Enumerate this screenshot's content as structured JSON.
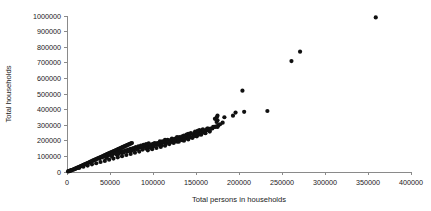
{
  "chart_data": {
    "type": "scatter",
    "title": "",
    "xlabel": "Total persons in households",
    "ylabel": "Total households",
    "xlim": [
      0,
      400000
    ],
    "ylim": [
      0,
      1000000
    ],
    "xticks": [
      0,
      50000,
      100000,
      150000,
      200000,
      250000,
      300000,
      350000,
      400000
    ],
    "yticks": [
      0,
      100000,
      200000,
      300000,
      400000,
      500000,
      600000,
      700000,
      800000,
      900000,
      1000000
    ],
    "xtick_labels": [
      "0",
      "50000",
      "100000",
      "150000",
      "200000",
      "250000",
      "300000",
      "350000",
      "400000"
    ],
    "ytick_labels": [
      "0",
      "100000",
      "200000",
      "300000",
      "400000",
      "500000",
      "600000",
      "700000",
      "800000",
      "900000",
      "1000000"
    ],
    "grid": false,
    "legend": false,
    "marker": "filled-circle",
    "marker_color": "#101010",
    "marker_size": 2.1,
    "series": [
      {
        "name": "households vs persons",
        "points": [
          [
            1200,
            3500
          ],
          [
            2400,
            5000
          ],
          [
            3600,
            8000
          ],
          [
            4800,
            10000
          ],
          [
            5500,
            12000
          ],
          [
            6500,
            14000
          ],
          [
            7600,
            16500
          ],
          [
            8500,
            19000
          ],
          [
            9600,
            21000
          ],
          [
            10400,
            23000
          ],
          [
            11500,
            26000
          ],
          [
            12400,
            28000
          ],
          [
            13500,
            31000
          ],
          [
            14600,
            33000
          ],
          [
            15500,
            36000
          ],
          [
            16400,
            38500
          ],
          [
            17500,
            41000
          ],
          [
            18600,
            44000
          ],
          [
            19500,
            46000
          ],
          [
            20500,
            49000
          ],
          [
            21500,
            51000
          ],
          [
            22600,
            54000
          ],
          [
            23500,
            56000
          ],
          [
            24500,
            59000
          ],
          [
            25500,
            61000
          ],
          [
            26400,
            64000
          ],
          [
            27500,
            66500
          ],
          [
            28500,
            69000
          ],
          [
            29500,
            71000
          ],
          [
            30500,
            74000
          ],
          [
            31500,
            76000
          ],
          [
            32500,
            79000
          ],
          [
            33500,
            81000
          ],
          [
            34600,
            84000
          ],
          [
            35500,
            86000
          ],
          [
            36500,
            89000
          ],
          [
            37500,
            91000
          ],
          [
            38500,
            94000
          ],
          [
            39500,
            96000
          ],
          [
            40500,
            99000
          ],
          [
            41500,
            101000
          ],
          [
            42500,
            104000
          ],
          [
            43500,
            106000
          ],
          [
            44500,
            109000
          ],
          [
            45500,
            111000
          ],
          [
            46500,
            114000
          ],
          [
            47500,
            116000
          ],
          [
            48500,
            119000
          ],
          [
            49500,
            121000
          ],
          [
            50500,
            124000
          ],
          [
            51500,
            126000
          ],
          [
            52500,
            129000
          ],
          [
            53500,
            131000
          ],
          [
            54500,
            134000
          ],
          [
            55500,
            136000
          ],
          [
            56500,
            139000
          ],
          [
            57500,
            141000
          ],
          [
            58500,
            144000
          ],
          [
            59500,
            146000
          ],
          [
            60500,
            149000
          ],
          [
            61500,
            151000
          ],
          [
            62500,
            154000
          ],
          [
            63500,
            156000
          ],
          [
            64500,
            159000
          ],
          [
            65500,
            161000
          ],
          [
            66500,
            164000
          ],
          [
            67500,
            166000
          ],
          [
            68500,
            169000
          ],
          [
            69500,
            171000
          ],
          [
            70500,
            174000
          ],
          [
            71500,
            176000
          ],
          [
            72500,
            179000
          ],
          [
            73500,
            181000
          ],
          [
            74500,
            184000
          ],
          [
            75500,
            186000
          ],
          [
            38000,
            86000
          ],
          [
            41000,
            94000
          ],
          [
            44000,
            99000
          ],
          [
            47000,
            104000
          ],
          [
            50000,
            109000
          ],
          [
            53000,
            114000
          ],
          [
            56000,
            119000
          ],
          [
            59000,
            124000
          ],
          [
            62000,
            129000
          ],
          [
            65000,
            134000
          ],
          [
            68000,
            139000
          ],
          [
            71000,
            144000
          ],
          [
            74000,
            149000
          ],
          [
            77000,
            154000
          ],
          [
            80000,
            159000
          ],
          [
            83000,
            164000
          ],
          [
            86000,
            169000
          ],
          [
            89000,
            174000
          ],
          [
            92000,
            179000
          ],
          [
            95000,
            184000
          ],
          [
            46000,
            91000
          ],
          [
            52000,
            101000
          ],
          [
            58000,
            111000
          ],
          [
            64000,
            121000
          ],
          [
            70000,
            131000
          ],
          [
            76000,
            141000
          ],
          [
            82000,
            151000
          ],
          [
            88000,
            161000
          ],
          [
            94000,
            171000
          ],
          [
            100000,
            181000
          ],
          [
            60000,
            116000
          ],
          [
            66000,
            126000
          ],
          [
            72000,
            136000
          ],
          [
            78000,
            146000
          ],
          [
            84000,
            156000
          ],
          [
            90000,
            166000
          ],
          [
            96000,
            176000
          ],
          [
            102000,
            186000
          ],
          [
            108000,
            196000
          ],
          [
            114000,
            206000
          ],
          [
            75000,
            136000
          ],
          [
            81000,
            146000
          ],
          [
            87000,
            156000
          ],
          [
            93000,
            166000
          ],
          [
            99000,
            176000
          ],
          [
            105000,
            186000
          ],
          [
            111000,
            196000
          ],
          [
            117000,
            206000
          ],
          [
            122000,
            214000
          ],
          [
            128000,
            224000
          ],
          [
            104000,
            176000
          ],
          [
            110000,
            186000
          ],
          [
            116000,
            196000
          ],
          [
            121000,
            204000
          ],
          [
            126000,
            214000
          ],
          [
            131000,
            224000
          ],
          [
            136000,
            234000
          ],
          [
            141000,
            244000
          ],
          [
            100000,
            166000
          ],
          [
            95000,
            156000
          ],
          [
            107000,
            181000
          ],
          [
            113000,
            191000
          ],
          [
            119000,
            201000
          ],
          [
            124000,
            209000
          ],
          [
            129000,
            219000
          ],
          [
            134000,
            229000
          ],
          [
            139000,
            239000
          ],
          [
            144000,
            249000
          ],
          [
            149000,
            259000
          ],
          [
            154000,
            269000
          ],
          [
            118000,
            191000
          ],
          [
            123000,
            199000
          ],
          [
            128000,
            209000
          ],
          [
            133000,
            219000
          ],
          [
            138000,
            229000
          ],
          [
            143000,
            239000
          ],
          [
            148000,
            249000
          ],
          [
            153000,
            259000
          ],
          [
            158000,
            269000
          ],
          [
            163000,
            279000
          ],
          [
            132000,
            209000
          ],
          [
            137000,
            219000
          ],
          [
            142000,
            229000
          ],
          [
            147000,
            239000
          ],
          [
            152000,
            249000
          ],
          [
            157000,
            259000
          ],
          [
            162000,
            269000
          ],
          [
            167000,
            279000
          ],
          [
            172000,
            289000
          ],
          [
            176000,
            299000
          ],
          [
            146000,
            219000
          ],
          [
            151000,
            229000
          ],
          [
            156000,
            239000
          ],
          [
            161000,
            249000
          ],
          [
            166000,
            259000
          ],
          [
            128000,
            194000
          ],
          [
            134000,
            204000
          ],
          [
            140000,
            214000
          ],
          [
            145000,
            221000
          ],
          [
            150000,
            231000
          ],
          [
            110000,
            171000
          ],
          [
            115000,
            179000
          ],
          [
            120000,
            189000
          ],
          [
            125000,
            196000
          ],
          [
            130000,
            204000
          ],
          [
            88000,
            144000
          ],
          [
            92000,
            151000
          ],
          [
            97000,
            159000
          ],
          [
            101000,
            166000
          ],
          [
            106000,
            174000
          ],
          [
            119000,
            179000
          ],
          [
            124000,
            186000
          ],
          [
            130000,
            194000
          ],
          [
            136000,
            201000
          ],
          [
            141000,
            209000
          ],
          [
            136000,
            211000
          ],
          [
            142000,
            221000
          ],
          [
            148000,
            231000
          ],
          [
            154000,
            241000
          ],
          [
            160000,
            251000
          ],
          [
            151000,
            249000
          ],
          [
            157000,
            259000
          ],
          [
            163000,
            269000
          ],
          [
            169000,
            279000
          ],
          [
            175000,
            289000
          ],
          [
            164000,
            279000
          ],
          [
            170000,
            289000
          ],
          [
            176000,
            299000
          ],
          [
            152000,
            264000
          ],
          [
            158000,
            274000
          ],
          [
            109000,
            161000
          ],
          [
            114000,
            169000
          ],
          [
            104000,
            154000
          ],
          [
            99000,
            146000
          ],
          [
            94000,
            139000
          ],
          [
            84000,
            131000
          ],
          [
            79000,
            124000
          ],
          [
            74000,
            116000
          ],
          [
            69000,
            109000
          ],
          [
            64000,
            101000
          ],
          [
            59000,
            94000
          ],
          [
            54000,
            86000
          ],
          [
            49000,
            79000
          ],
          [
            44000,
            71000
          ],
          [
            39000,
            64000
          ],
          [
            34000,
            56000
          ],
          [
            29000,
            49000
          ],
          [
            24000,
            41000
          ],
          [
            19000,
            34000
          ],
          [
            14000,
            26000
          ],
          [
            9000,
            19000
          ],
          [
            4000,
            11000
          ],
          [
            2000,
            6000
          ],
          [
            159000,
            264000
          ],
          [
            166000,
            271000
          ],
          [
            173000,
            291000
          ],
          [
            178000,
            306000
          ],
          [
            181000,
            316000
          ],
          [
            172000,
            341000
          ],
          [
            174000,
            351000
          ],
          [
            175000,
            331000
          ],
          [
            193000,
            361000
          ],
          [
            174000,
            321000
          ],
          [
            196000,
            381000
          ],
          [
            204000,
            521000
          ],
          [
            175000,
            361000
          ],
          [
            183000,
            351000
          ],
          [
            206000,
            386000
          ],
          [
            233000,
            391000
          ],
          [
            261000,
            711000
          ],
          [
            271000,
            771000
          ],
          [
            359000,
            991000
          ]
        ]
      }
    ]
  },
  "geometry": {
    "plot_x0": 67,
    "plot_x1": 411,
    "plot_y0": 172,
    "plot_y1": 16
  }
}
